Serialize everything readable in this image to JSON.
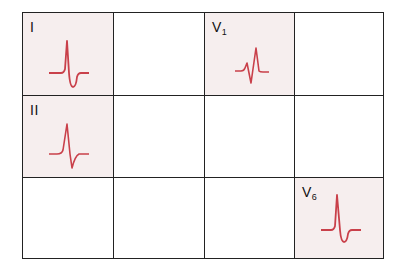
{
  "diagram": {
    "type": "ecg-lead-grid",
    "rows": 3,
    "columns": 4,
    "highlight_color": "#f6eeee",
    "wave_color": "#c9404a",
    "cells": [
      {
        "row": 1,
        "col": 1,
        "lead": "I",
        "lead_main": "I",
        "lead_sub": "",
        "highlighted": true,
        "waveform": "qRs-negative-st"
      },
      {
        "row": 1,
        "col": 2,
        "lead": "",
        "highlighted": false
      },
      {
        "row": 1,
        "col": 3,
        "lead": "V1",
        "lead_main": "V",
        "lead_sub": "1",
        "highlighted": true,
        "waveform": "rsR-prime"
      },
      {
        "row": 1,
        "col": 4,
        "lead": "",
        "highlighted": false
      },
      {
        "row": 2,
        "col": 1,
        "lead": "II",
        "lead_main": "II",
        "lead_sub": "",
        "highlighted": true,
        "waveform": "Rs-biphasic"
      },
      {
        "row": 2,
        "col": 2,
        "lead": "",
        "highlighted": false
      },
      {
        "row": 2,
        "col": 3,
        "lead": "",
        "highlighted": false
      },
      {
        "row": 2,
        "col": 4,
        "lead": "",
        "highlighted": false
      },
      {
        "row": 3,
        "col": 1,
        "lead": "",
        "highlighted": false
      },
      {
        "row": 3,
        "col": 2,
        "lead": "",
        "highlighted": false
      },
      {
        "row": 3,
        "col": 3,
        "lead": "",
        "highlighted": false
      },
      {
        "row": 3,
        "col": 4,
        "lead": "V6",
        "lead_main": "V",
        "lead_sub": "6",
        "highlighted": true,
        "waveform": "qRs-negative-st"
      }
    ]
  }
}
